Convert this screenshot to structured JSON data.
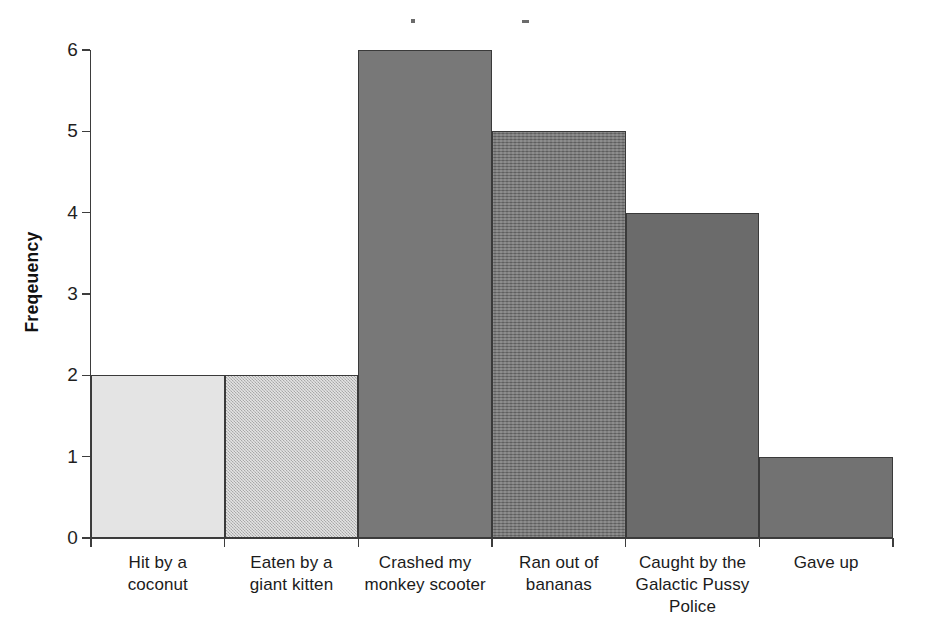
{
  "chart_data": {
    "type": "bar",
    "title": "",
    "xlabel": "",
    "ylabel": "Freqeuency",
    "categories": [
      "Hit by a coconut",
      "Eaten by a giant kitten",
      "Crashed my monkey scooter",
      "Ran out of bananas",
      "Caught by the Galactic Pussy Police",
      "Gave up"
    ],
    "category_lines": [
      [
        "Hit by a",
        "coconut"
      ],
      [
        "Eaten by a",
        "giant kitten"
      ],
      [
        "Crashed my",
        "monkey scooter"
      ],
      [
        "Ran out of",
        "bananas"
      ],
      [
        "Caught by the",
        "Galactic Pussy",
        "Police"
      ],
      [
        "Gave up"
      ]
    ],
    "values": [
      2,
      2,
      6,
      5,
      4,
      1
    ],
    "ylim": [
      0,
      6
    ],
    "yticks": [
      0,
      1,
      2,
      3,
      4,
      5,
      6
    ],
    "ytick_labels": [
      "0",
      "1",
      "2",
      "3",
      "4",
      "5",
      "6"
    ],
    "grid": false,
    "legend": false,
    "bar_styles": [
      "light-solid",
      "checkered-light",
      "mid-solid",
      "horizontal-stripe",
      "dark-solid",
      "dark-solid"
    ],
    "bar_colors": [
      "#e4e4e4",
      "#c0c0c0",
      "#787878",
      "#707070",
      "#6b6b6b",
      "#727272"
    ],
    "bar_edge_color": "#3a3a3a",
    "axis_color": "#3d3d3d",
    "background_color": "#ffffff"
  },
  "artifacts": {
    "speck_1": "scan-speck",
    "speck_2": "scan-speck"
  }
}
